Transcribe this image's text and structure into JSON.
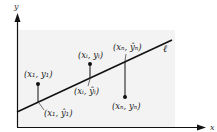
{
  "diagram": {
    "colors": {
      "background": "#ffffff",
      "shaded_region": "#f3f3f3",
      "ink": "#111111"
    },
    "axes": {
      "x_label": "x",
      "y_label": "y"
    },
    "line": {
      "label": "ℓ"
    },
    "points": [
      {
        "id": "1",
        "observed_label": "(x₁, y₁)",
        "fitted_label": "(x₁, ŷ₁)"
      },
      {
        "id": "i",
        "observed_label": "(xᵢ, yᵢ)",
        "fitted_label": "(xᵢ, ŷᵢ)"
      },
      {
        "id": "n",
        "observed_label": "(xₙ, yₙ)",
        "fitted_label": "(xₙ, ŷₙ)"
      }
    ]
  }
}
